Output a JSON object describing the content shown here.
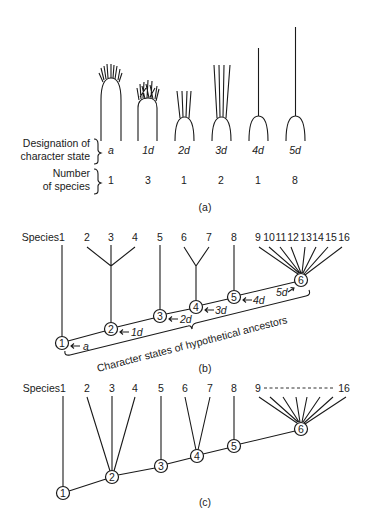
{
  "panel_a": {
    "row1_label": [
      "Designation of",
      "character state"
    ],
    "row2_label": [
      "Number",
      "of species"
    ],
    "states": [
      {
        "designation": "a",
        "count": "1",
        "x": 111
      },
      {
        "designation": "1d",
        "count": "3",
        "x": 148
      },
      {
        "designation": "2d",
        "count": "1",
        "x": 184
      },
      {
        "designation": "3d",
        "count": "2",
        "x": 221
      },
      {
        "designation": "4d",
        "count": "1",
        "x": 258
      },
      {
        "designation": "5d",
        "count": "8",
        "x": 295
      }
    ],
    "caption": "(a)"
  },
  "panel_b": {
    "species_label": "Species",
    "species": [
      "1",
      "2",
      "3",
      "4",
      "5",
      "6",
      "7",
      "8",
      "9",
      "10",
      "11",
      "12",
      "13",
      "14",
      "15",
      "16"
    ],
    "nodes": [
      "1",
      "2",
      "3",
      "4",
      "5",
      "6"
    ],
    "state_arrows": [
      "a",
      "1d",
      "2d",
      "3d",
      "4d",
      "5d"
    ],
    "brace_label": "Character states of hypothetical ancestors",
    "caption": "(b)"
  },
  "panel_c": {
    "species_label": "Species",
    "species": [
      "1",
      "2",
      "3",
      "4",
      "5",
      "6",
      "7",
      "8"
    ],
    "range_start": "9",
    "range_end": "16",
    "nodes": [
      "1",
      "2",
      "3",
      "4",
      "5",
      "6"
    ],
    "caption": "(c)"
  }
}
